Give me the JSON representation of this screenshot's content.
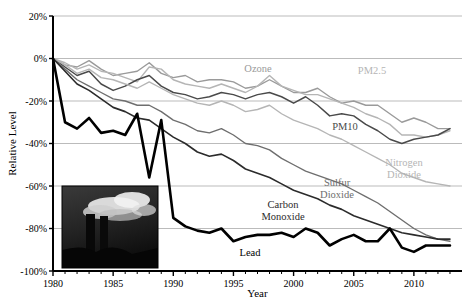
{
  "chart_data": {
    "type": "line",
    "title": "",
    "xlabel": "Year",
    "ylabel": "Relative Level",
    "xlim": [
      1980,
      2014
    ],
    "ylim": [
      -100,
      20
    ],
    "grid": true,
    "legend_position": "inline-labels",
    "y_ticks": [
      "20%",
      "0%",
      "-20%",
      "-40%",
      "-60%",
      "-80%",
      "-100%"
    ],
    "y_tick_values": [
      20,
      0,
      -20,
      -40,
      -60,
      -80,
      -100
    ],
    "x_ticks": [
      "1980",
      "1985",
      "1990",
      "1995",
      "2000",
      "2005",
      "2010"
    ],
    "x_tick_values": [
      1980,
      1985,
      1990,
      1995,
      2000,
      2005,
      2010
    ],
    "x": [
      1980,
      1981,
      1982,
      1983,
      1984,
      1985,
      1986,
      1987,
      1988,
      1989,
      1990,
      1991,
      1992,
      1993,
      1994,
      1995,
      1996,
      1997,
      1998,
      1999,
      2000,
      2001,
      2002,
      2003,
      2004,
      2005,
      2006,
      2007,
      2008,
      2009,
      2010,
      2011,
      2012,
      2013
    ],
    "series": [
      {
        "name": "Ozone",
        "label": "Ozone",
        "color": "#9a9a9a",
        "width": 1.4,
        "label_x": 258,
        "label_y": 72,
        "values": [
          0,
          -3,
          -4,
          -1,
          -5,
          -8,
          -7,
          -6,
          -2,
          -7,
          -9,
          -8,
          -11,
          -10,
          -10,
          -11,
          -14,
          -13,
          -10,
          -13,
          -16,
          -16,
          -14,
          -18,
          -21,
          -20,
          -22,
          -22,
          -26,
          -30,
          -28,
          -30,
          -33,
          -33
        ]
      },
      {
        "name": "PM2.5",
        "label": "PM2.5",
        "color": "#b5b5b5",
        "width": 1.4,
        "label_x": 372,
        "label_y": 74,
        "values": [
          0,
          -2,
          -5,
          -3,
          -6,
          -7,
          -9,
          -11,
          -4,
          -5,
          -10,
          -12,
          -13,
          -14,
          -12,
          -14,
          -16,
          -13,
          -8,
          -13,
          -15,
          -17,
          -17,
          -19,
          -21,
          -23,
          -26,
          -28,
          -31,
          -36,
          -36,
          -37,
          -36,
          -34
        ]
      },
      {
        "name": "PM10",
        "label": "PM10",
        "color": "#4a4a4a",
        "width": 1.5,
        "label_x": 345,
        "label_y": 130,
        "values": [
          0,
          -4,
          -8,
          -6,
          -12,
          -15,
          -13,
          -10,
          -8,
          -13,
          -16,
          -17,
          -19,
          -18,
          -16,
          -17,
          -19,
          -17,
          -16,
          -18,
          -21,
          -18,
          -22,
          -27,
          -26,
          -27,
          -31,
          -34,
          -38,
          -40,
          -38,
          -37,
          -36,
          -33
        ]
      },
      {
        "name": "Nitrogen Dioxide",
        "label": "Nitrogen Dioxide",
        "color": "#b5b5b5",
        "width": 1.4,
        "label_x": 404,
        "label_y": 166,
        "values": [
          0,
          -3,
          -7,
          -5,
          -9,
          -10,
          -12,
          -14,
          -11,
          -14,
          -17,
          -19,
          -21,
          -22,
          -20,
          -22,
          -25,
          -24,
          -22,
          -26,
          -29,
          -31,
          -33,
          -36,
          -38,
          -41,
          -44,
          -47,
          -50,
          -54,
          -56,
          -58,
          -59,
          -60
        ]
      },
      {
        "name": "Sulfur Dioxide",
        "label": "Sulfur Dioxide",
        "color": "#6e6e6e",
        "width": 1.4,
        "label_x": 337,
        "label_y": 186,
        "values": [
          0,
          -5,
          -10,
          -13,
          -16,
          -19,
          -20,
          -22,
          -22,
          -25,
          -29,
          -31,
          -34,
          -35,
          -33,
          -36,
          -40,
          -41,
          -43,
          -47,
          -50,
          -53,
          -55,
          -57,
          -59,
          -62,
          -65,
          -68,
          -72,
          -76,
          -80,
          -83,
          -85,
          -86
        ]
      },
      {
        "name": "Carbon Monoxide",
        "label": "Carbon Monoxide",
        "color": "#2b2b2b",
        "width": 1.6,
        "label_x": 283,
        "label_y": 208,
        "values": [
          0,
          -6,
          -12,
          -15,
          -19,
          -23,
          -25,
          -28,
          -29,
          -33,
          -37,
          -40,
          -44,
          -46,
          -45,
          -48,
          -52,
          -54,
          -56,
          -59,
          -62,
          -64,
          -66,
          -69,
          -71,
          -74,
          -76,
          -78,
          -80,
          -82,
          -83,
          -84,
          -85,
          -85
        ]
      },
      {
        "name": "Lead",
        "label": "Lead",
        "color": "#000000",
        "width": 2.6,
        "label_x": 250,
        "label_y": 256,
        "values": [
          0,
          -30,
          -33,
          -28,
          -35,
          -34,
          -36,
          -26,
          -56,
          -29,
          -75,
          -79,
          -81,
          -82,
          -80,
          -86,
          -84,
          -83,
          -83,
          -82,
          -84,
          -80,
          -82,
          -88,
          -85,
          -83,
          -86,
          -86,
          -80,
          -89,
          -91,
          -88,
          -88,
          -88
        ]
      }
    ],
    "photo": {
      "name": "smokestacks-photo",
      "alt": "smokestacks emitting smoke",
      "x": 62,
      "y": 186,
      "width": 96,
      "height": 82
    }
  }
}
